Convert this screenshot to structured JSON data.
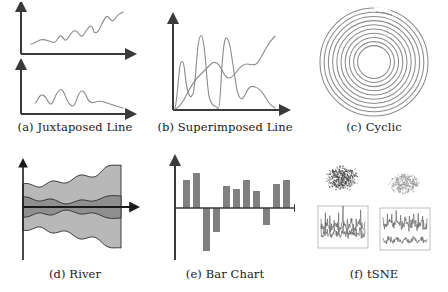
{
  "figure": {
    "background": "#ffffff",
    "line_color": "#8c8c8c",
    "axis_color": "#3a3a3a",
    "bar_color": "#808080",
    "band_outer_color": "#b8b8b8",
    "band_inner_color": "#8f8f8f",
    "caption_color": "#1a1a1a"
  },
  "panels": [
    {
      "id": "juxtaposed-line",
      "caption": "(a) Juxtaposed Line",
      "label": "a",
      "name": "Juxtaposed Line"
    },
    {
      "id": "superimposed-line",
      "caption": "(b) Superimposed Line",
      "label": "b",
      "name": "Superimposed Line"
    },
    {
      "id": "cyclic",
      "caption": "(c) Cyclic",
      "label": "c",
      "name": "Cyclic"
    },
    {
      "id": "river",
      "caption": "(d) River",
      "label": "d",
      "name": "River"
    },
    {
      "id": "bar-chart",
      "caption": "(e) Bar Chart",
      "label": "e",
      "name": "Bar Chart"
    },
    {
      "id": "tsne",
      "caption": "(f) tSNE",
      "label": "f",
      "name": "tSNE"
    }
  ],
  "chart_data": [
    {
      "type": "line",
      "id": "juxtaposed-line-top",
      "title": "(a) Juxtaposed Line — upper series",
      "xlabel": "",
      "ylabel": "",
      "grid": false,
      "legend": "none",
      "xlim": [
        0,
        100
      ],
      "ylim": [
        0,
        100
      ],
      "series": [
        {
          "name": "series-1",
          "x": [
            0,
            4,
            8,
            12,
            16,
            20,
            24,
            28,
            32,
            36,
            40,
            44,
            48,
            52,
            56,
            60,
            64,
            68,
            72,
            76,
            80,
            84,
            88,
            92,
            96,
            100
          ],
          "values": [
            22,
            26,
            30,
            28,
            31,
            34,
            29,
            27,
            32,
            42,
            38,
            36,
            44,
            52,
            58,
            52,
            46,
            44,
            50,
            64,
            72,
            66,
            62,
            72,
            80,
            84
          ]
        }
      ]
    },
    {
      "type": "line",
      "id": "juxtaposed-line-bottom",
      "title": "(a) Juxtaposed Line — lower series",
      "xlabel": "",
      "ylabel": "",
      "grid": false,
      "legend": "none",
      "xlim": [
        0,
        100
      ],
      "ylim": [
        0,
        100
      ],
      "series": [
        {
          "name": "series-2",
          "x": [
            0,
            4,
            8,
            12,
            16,
            20,
            24,
            28,
            32,
            36,
            40,
            44,
            48,
            52,
            56,
            60,
            64,
            68,
            72,
            76,
            80,
            84,
            88,
            92,
            96,
            100
          ],
          "values": [
            30,
            34,
            48,
            40,
            36,
            60,
            64,
            52,
            38,
            34,
            62,
            66,
            56,
            46,
            42,
            40,
            38,
            36,
            38,
            40,
            38,
            34,
            32,
            30,
            28,
            24
          ]
        }
      ]
    },
    {
      "type": "line",
      "id": "superimposed-line",
      "title": "(b) Superimposed Line",
      "xlabel": "",
      "ylabel": "",
      "grid": false,
      "legend": "none",
      "xlim": [
        0,
        100
      ],
      "ylim": [
        0,
        100
      ],
      "series": [
        {
          "name": "spiky-series",
          "x": [
            0,
            4,
            8,
            12,
            16,
            20,
            24,
            28,
            32,
            36,
            40,
            44,
            48,
            52,
            56,
            60,
            64,
            68,
            72,
            76,
            80,
            84,
            88,
            92,
            96,
            100
          ],
          "values": [
            58,
            44,
            56,
            30,
            22,
            84,
            92,
            46,
            26,
            20,
            10,
            2,
            72,
            86,
            68,
            44,
            28,
            20,
            34,
            42,
            40,
            34,
            20,
            8,
            4,
            2
          ]
        },
        {
          "name": "smooth-series",
          "x": [
            0,
            4,
            8,
            12,
            16,
            20,
            24,
            28,
            32,
            36,
            40,
            44,
            48,
            52,
            56,
            60,
            64,
            68,
            72,
            76,
            80,
            84,
            88,
            92,
            96,
            100
          ],
          "values": [
            2,
            4,
            10,
            22,
            30,
            34,
            38,
            44,
            56,
            62,
            58,
            56,
            60,
            56,
            50,
            52,
            58,
            56,
            54,
            58,
            62,
            66,
            70,
            76,
            82,
            86
          ]
        }
      ]
    },
    {
      "type": "line",
      "id": "cyclic-spiral",
      "title": "(c) Cyclic",
      "xlabel": "",
      "ylabel": "",
      "grid": false,
      "legend": "none",
      "coordinate_system": "polar-spiral",
      "turns": 10,
      "inner_radius": 16,
      "outer_radius": 54,
      "note": "Archimedean spiral rendered as ~10 nested rings"
    },
    {
      "type": "area",
      "id": "river",
      "title": "(d) River",
      "xlabel": "",
      "ylabel": "",
      "grid": false,
      "legend": "none",
      "stacking": "symmetric-streamgraph",
      "xlim": [
        0,
        100
      ],
      "series": [
        {
          "name": "inner-band",
          "color": "#8f8f8f",
          "x": [
            0,
            10,
            20,
            30,
            40,
            50,
            60,
            70,
            80,
            90,
            100
          ],
          "values": [
            10,
            13,
            11,
            14,
            12,
            13,
            11,
            14,
            12,
            10,
            9
          ]
        },
        {
          "name": "outer-band",
          "color": "#b8b8b8",
          "x": [
            0,
            10,
            20,
            30,
            40,
            50,
            60,
            70,
            80,
            90,
            100
          ],
          "values": [
            18,
            24,
            20,
            26,
            22,
            28,
            24,
            34,
            44,
            50,
            52
          ]
        }
      ]
    },
    {
      "type": "bar",
      "id": "bar-chart",
      "title": "(e) Bar Chart",
      "xlabel": "",
      "ylabel": "",
      "grid": false,
      "legend": "none",
      "baseline": 0,
      "ylim": [
        -60,
        60
      ],
      "categories": [
        "1",
        "2",
        "3",
        "4",
        "5",
        "6",
        "7",
        "8",
        "9",
        "10",
        "11"
      ],
      "values": [
        38,
        48,
        -58,
        -32,
        30,
        26,
        38,
        24,
        -22,
        32,
        38
      ],
      "color": "#808080"
    },
    {
      "type": "scatter",
      "id": "tsne",
      "title": "(f) tSNE",
      "xlabel": "",
      "ylabel": "",
      "grid": false,
      "legend": "none",
      "clusters": [
        {
          "name": "cluster-left",
          "n_points": 420,
          "color": "#4a4a4a",
          "density": "dense"
        },
        {
          "name": "cluster-right",
          "n_points": 320,
          "color": "#9a9a9a",
          "density": "sparse"
        }
      ],
      "insets": [
        {
          "name": "inset-left",
          "type": "line",
          "traces": 1,
          "note": "dense oscillating waveform in bordered box"
        },
        {
          "name": "inset-right",
          "type": "line",
          "traces": 2,
          "note": "two stacked waveform traces in bordered box"
        }
      ]
    }
  ]
}
